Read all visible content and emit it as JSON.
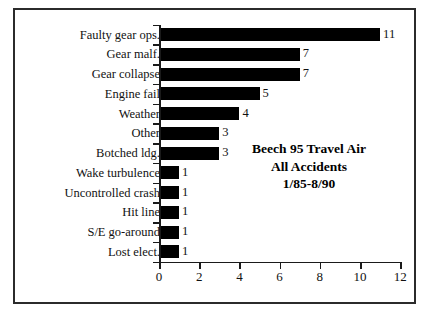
{
  "chart_data": {
    "type": "bar",
    "orientation": "horizontal",
    "title": "",
    "xlabel": "",
    "ylabel": "",
    "xlim": [
      0,
      12
    ],
    "xticks": [
      "0",
      "2",
      "4",
      "6",
      "8",
      "10",
      "12"
    ],
    "grid": false,
    "legend": null,
    "bar_color": "#000000",
    "categories": [
      "Faulty gear ops.",
      "Gear malf.",
      "Gear collapse",
      "Engine fail",
      "Weather",
      "Other",
      "Botched ldg.",
      "Wake turbulence",
      "Uncontrolled crash",
      "Hit line",
      "S/E go-around",
      "Lost elect."
    ],
    "values": [
      11,
      7,
      7,
      5,
      4,
      3,
      3,
      1,
      1,
      1,
      1,
      1
    ],
    "value_labels": [
      "11",
      "7",
      "7",
      "5",
      "4",
      "3",
      "3",
      "1",
      "1",
      "1",
      "1",
      "1"
    ],
    "annotation": {
      "line1": "Beech 95 Travel Air",
      "line2": "All Accidents",
      "line3": "1/85-8/90"
    }
  }
}
